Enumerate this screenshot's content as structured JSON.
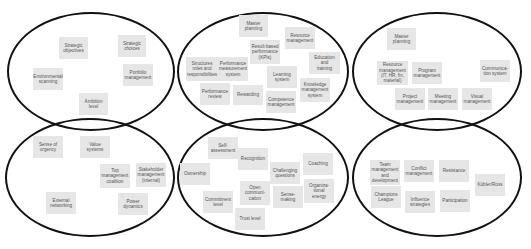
{
  "colors": {
    "outline": "#111111",
    "card_bg": "#e6e6e6",
    "card_text": "#555555",
    "background": "#ffffff"
  },
  "ellipses": [
    {
      "id": "strategy",
      "x": 7,
      "y": 12,
      "w": 168,
      "h": 119
    },
    {
      "id": "structure-systems",
      "x": 177,
      "y": 12,
      "w": 172,
      "h": 119
    },
    {
      "id": "program-management",
      "x": 352,
      "y": 12,
      "w": 170,
      "h": 119
    },
    {
      "id": "culture-power",
      "x": 5,
      "y": 118,
      "w": 170,
      "h": 119
    },
    {
      "id": "behaviour",
      "x": 177,
      "y": 118,
      "w": 172,
      "h": 119
    },
    {
      "id": "people-change",
      "x": 352,
      "y": 118,
      "w": 170,
      "h": 119
    }
  ],
  "groups": [
    {
      "name": "strategy",
      "cards": [
        {
          "label": "Strategic\nobjectives",
          "x": 59,
          "y": 37,
          "w": 29,
          "h": 22
        },
        {
          "label": "Strategic\nchoices",
          "x": 118,
          "y": 35,
          "w": 28,
          "h": 22
        },
        {
          "label": "Environmental\nscanning",
          "x": 33,
          "y": 68,
          "w": 30,
          "h": 22
        },
        {
          "label": "Portfolio\nmanagement",
          "x": 123,
          "y": 64,
          "w": 30,
          "h": 22
        },
        {
          "label": "Ambition\nlevel",
          "x": 79,
          "y": 93,
          "w": 29,
          "h": 22
        }
      ]
    },
    {
      "name": "structure-systems",
      "cards": [
        {
          "label": "Master\nplanning",
          "x": 239,
          "y": 15,
          "w": 29,
          "h": 22
        },
        {
          "label": "Resource\nmanagement",
          "x": 285,
          "y": 27,
          "w": 30,
          "h": 22
        },
        {
          "label": "Result-based\nperformance\n(KPIs)",
          "x": 250,
          "y": 40,
          "w": 30,
          "h": 24
        },
        {
          "label": "Structures\nroles and\nresponsibilities",
          "x": 186,
          "y": 57,
          "w": 32,
          "h": 24
        },
        {
          "label": "Performance\nmeasurement\nsystem",
          "x": 218,
          "y": 57,
          "w": 30,
          "h": 24
        },
        {
          "label": "Education and\ntraining",
          "x": 309,
          "y": 52,
          "w": 31,
          "h": 22
        },
        {
          "label": "Learning\nsystem",
          "x": 267,
          "y": 66,
          "w": 30,
          "h": 22
        },
        {
          "label": "Knowledge\nmanagement\nsystem",
          "x": 300,
          "y": 78,
          "w": 30,
          "h": 24
        },
        {
          "label": "Performance\nreview",
          "x": 200,
          "y": 83,
          "w": 30,
          "h": 22
        },
        {
          "label": "Rewarding",
          "x": 233,
          "y": 85,
          "w": 30,
          "h": 20
        },
        {
          "label": "Competence\nmanagement",
          "x": 266,
          "y": 91,
          "w": 30,
          "h": 22
        }
      ]
    },
    {
      "name": "program-management",
      "cards": [
        {
          "label": "Master\nplanning",
          "x": 387,
          "y": 28,
          "w": 29,
          "h": 22
        },
        {
          "label": "Resource\nmanagement\n(IT, HR, fin,\nmaterial)",
          "x": 377,
          "y": 61,
          "w": 31,
          "h": 24
        },
        {
          "label": "Program\nmanagement",
          "x": 412,
          "y": 62,
          "w": 30,
          "h": 22
        },
        {
          "label": "Communica-\ntion system",
          "x": 480,
          "y": 60,
          "w": 30,
          "h": 22
        },
        {
          "label": "Project\nmanagement",
          "x": 395,
          "y": 88,
          "w": 30,
          "h": 22
        },
        {
          "label": "Meeting\nmanagement",
          "x": 428,
          "y": 88,
          "w": 30,
          "h": 22
        },
        {
          "label": "Visual\nmanagement",
          "x": 462,
          "y": 88,
          "w": 30,
          "h": 22
        }
      ]
    },
    {
      "name": "culture-power",
      "cards": [
        {
          "label": "Sense of\nurgency",
          "x": 33,
          "y": 136,
          "w": 30,
          "h": 22
        },
        {
          "label": "Value\nsystems",
          "x": 80,
          "y": 136,
          "w": 30,
          "h": 22
        },
        {
          "label": "Top\nmanagement\ncoalition",
          "x": 100,
          "y": 164,
          "w": 30,
          "h": 24
        },
        {
          "label": "Stakeholder\nmanagement\n(internal)",
          "x": 136,
          "y": 163,
          "w": 30,
          "h": 24
        },
        {
          "label": "External\nnetworking",
          "x": 46,
          "y": 192,
          "w": 30,
          "h": 22
        },
        {
          "label": "Power\ndynamics",
          "x": 118,
          "y": 193,
          "w": 30,
          "h": 22
        }
      ]
    },
    {
      "name": "behaviour",
      "cards": [
        {
          "label": "Self-\nassessment",
          "x": 208,
          "y": 137,
          "w": 30,
          "h": 22
        },
        {
          "label": "Recognition",
          "x": 238,
          "y": 148,
          "w": 30,
          "h": 22
        },
        {
          "label": "Challenging\nquestions",
          "x": 270,
          "y": 162,
          "w": 30,
          "h": 22
        },
        {
          "label": "Coaching",
          "x": 303,
          "y": 153,
          "w": 30,
          "h": 22
        },
        {
          "label": "Ownership",
          "x": 180,
          "y": 163,
          "w": 30,
          "h": 22
        },
        {
          "label": "Organiza-\ntional\nenergy",
          "x": 304,
          "y": 179,
          "w": 30,
          "h": 24
        },
        {
          "label": "Open\ncommuni-\ncation",
          "x": 240,
          "y": 181,
          "w": 30,
          "h": 24
        },
        {
          "label": "Sense-making",
          "x": 273,
          "y": 186,
          "w": 30,
          "h": 22
        },
        {
          "label": "Commitment\nlevel",
          "x": 203,
          "y": 191,
          "w": 30,
          "h": 22
        },
        {
          "label": "Trust level",
          "x": 235,
          "y": 208,
          "w": 30,
          "h": 22
        }
      ]
    },
    {
      "name": "people-change",
      "cards": [
        {
          "label": "Team\nmanagement\nand\ndevelopment",
          "x": 370,
          "y": 160,
          "w": 30,
          "h": 25
        },
        {
          "label": "Conflict\nmanagement",
          "x": 404,
          "y": 160,
          "w": 30,
          "h": 22
        },
        {
          "label": "Resistance",
          "x": 439,
          "y": 160,
          "w": 30,
          "h": 22
        },
        {
          "label": "Kübler/Ross",
          "x": 475,
          "y": 174,
          "w": 30,
          "h": 22
        },
        {
          "label": "Champions\nLeague",
          "x": 371,
          "y": 186,
          "w": 30,
          "h": 22
        },
        {
          "label": "Influence\nstrategies",
          "x": 405,
          "y": 191,
          "w": 30,
          "h": 22
        },
        {
          "label": "Participation",
          "x": 440,
          "y": 190,
          "w": 30,
          "h": 22
        }
      ]
    }
  ]
}
